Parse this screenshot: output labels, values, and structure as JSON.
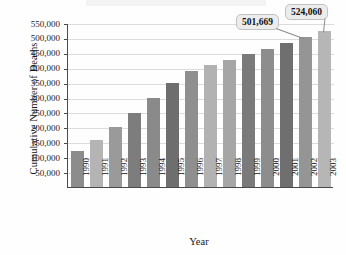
{
  "chart_data": {
    "type": "bar",
    "title": "",
    "subtitle": "",
    "xlabel": "Year",
    "ylabel": "Cumulative Number of Deaths",
    "categories": [
      "1990",
      "1991",
      "1992",
      "1993",
      "1994",
      "1995",
      "1996",
      "1997",
      "1998",
      "1999",
      "2000",
      "2001",
      "2002",
      "2003"
    ],
    "values": [
      121577,
      158843,
      200609,
      247601,
      297312,
      349217,
      387882,
      408669,
      427412,
      445425,
      462653,
      481469,
      501669,
      524060
    ],
    "ylim": [
      0,
      550000
    ],
    "ytick_values": [
      50000,
      100000,
      150000,
      200000,
      250000,
      300000,
      350000,
      400000,
      450000,
      500000,
      550000
    ],
    "ytick_labels": [
      "50,000",
      "100,000",
      "150,000",
      "200,000",
      "250,000",
      "300,000",
      "350,000",
      "400,000",
      "450,000",
      "500,000",
      "550,000"
    ],
    "grid": true,
    "legend": false,
    "legend_position": "none",
    "bar_colors": [
      "#8c8c8c",
      "#b4b4b4",
      "#9a9a9a",
      "#7d7d7d",
      "#8a8a8a",
      "#6e6e6e",
      "#8f8f8f",
      "#b2b2b2",
      "#a6a6a6",
      "#7a7a7a",
      "#8d8d8d",
      "#6f6f6f",
      "#959595",
      "#b6b6b6"
    ],
    "annotations": [
      {
        "label": "501,669",
        "category": "2002",
        "value": 501669
      },
      {
        "label": "524,060",
        "category": "2003",
        "value": 524060
      }
    ]
  },
  "axis": {
    "ylabel": "Cumulative Number of Deaths",
    "xlabel": "Year"
  }
}
